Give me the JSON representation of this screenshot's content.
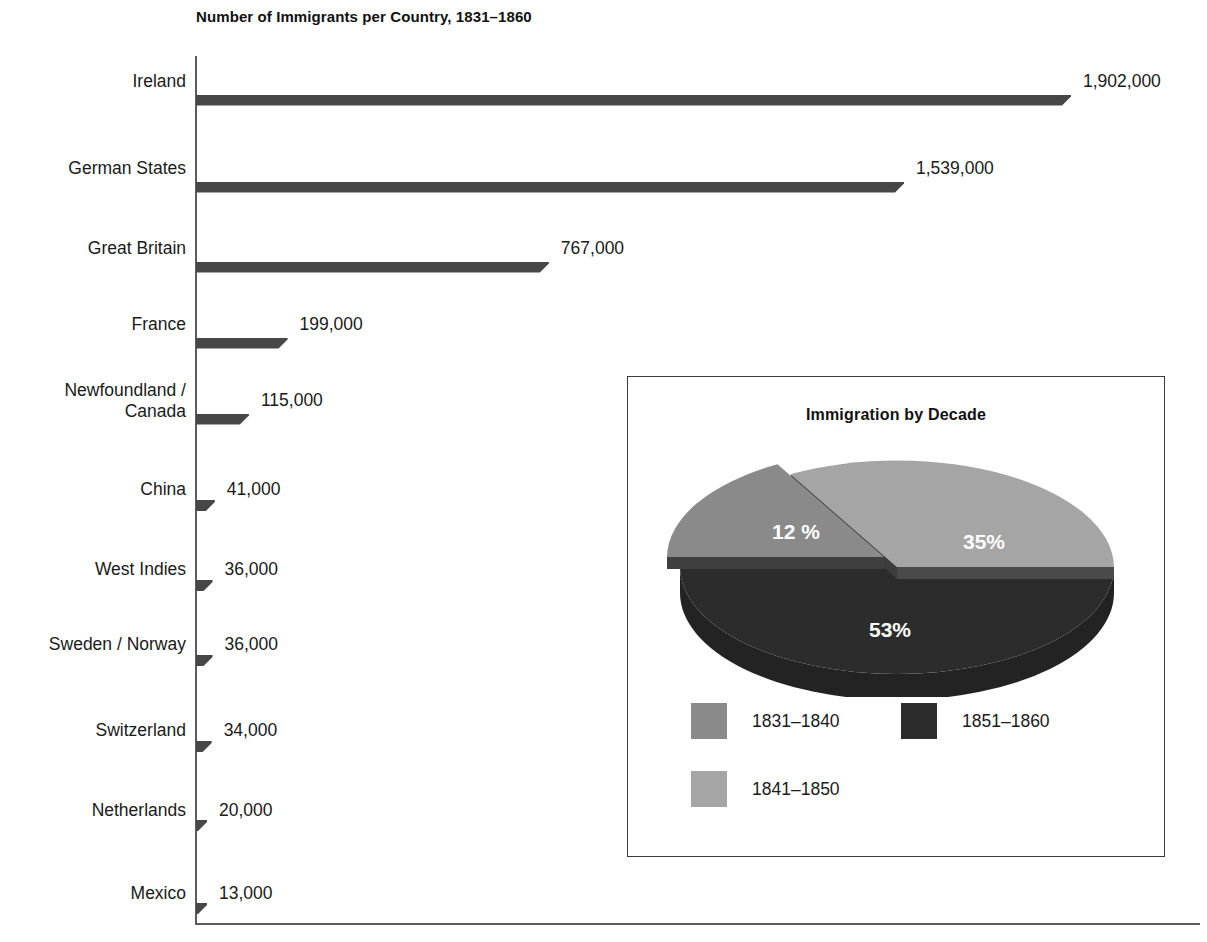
{
  "chart_data": {
    "type": "bar",
    "orientation": "horizontal",
    "title": "Number of Immigrants per Country, 1831–1860",
    "xlabel": "",
    "ylabel": "",
    "grid": false,
    "xlim": [
      0,
      1902000
    ],
    "categories": [
      "Ireland",
      "German States",
      "Great Britain",
      "France",
      "Newfoundland /\nCanada",
      "China",
      "West Indies",
      "Sweden / Norway",
      "Switzerland",
      "Netherlands",
      "Mexico"
    ],
    "values": [
      1902000,
      1539000,
      767000,
      199000,
      115000,
      41000,
      36000,
      36000,
      34000,
      20000,
      13000
    ],
    "value_labels": [
      "1,902,000",
      "1,539,000",
      "767,000",
      "199,000",
      "115,000",
      "41,000",
      "36,000",
      "36,000",
      "34,000",
      "20,000",
      "13,000"
    ],
    "bar_color": "#7d7d7d",
    "bar_shadow_color": "#474747"
  },
  "bars": [
    {
      "label": "Ireland",
      "value_label": "1,902,000",
      "value": 1902000
    },
    {
      "label": "German States",
      "value_label": "1,539,000",
      "value": 1539000
    },
    {
      "label": "Great Britain",
      "value_label": "767,000",
      "value": 767000
    },
    {
      "label": "France",
      "value_label": "199,000",
      "value": 199000
    },
    {
      "label": "Newfoundland /\nCanada",
      "value_label": "115,000",
      "value": 115000
    },
    {
      "label": "China",
      "value_label": "41,000",
      "value": 41000
    },
    {
      "label": "West Indies",
      "value_label": "36,000",
      "value": 36000
    },
    {
      "label": "Sweden / Norway",
      "value_label": "36,000",
      "value": 36000
    },
    {
      "label": "Switzerland",
      "value_label": "34,000",
      "value": 34000
    },
    {
      "label": "Netherlands",
      "value_label": "20,000",
      "value": 20000
    },
    {
      "label": "Mexico",
      "value_label": "13,000",
      "value": 13000
    }
  ],
  "inset": {
    "title": "Immigration by Decade",
    "pie_chart_data": {
      "type": "pie",
      "title": "Immigration by Decade",
      "labels": [
        "1831–1840",
        "1841–1850",
        "1851–1860"
      ],
      "values": [
        12,
        35,
        53
      ],
      "value_labels": [
        "12 %",
        "35%",
        "53%"
      ],
      "colors": [
        "#8a8a8a",
        "#a5a5a5",
        "#2c2c2c"
      ],
      "exploded": [
        "1831–1840"
      ],
      "legend_position": "bottom"
    },
    "slice_labels": {
      "first": "12 %",
      "second": "35%",
      "third": "53%"
    },
    "legend": [
      {
        "label": "1831–1840",
        "color": "#8a8a8a"
      },
      {
        "label": "1851–1860",
        "color": "#2c2c2c"
      },
      {
        "label": "1841–1850",
        "color": "#a5a5a5"
      }
    ]
  }
}
